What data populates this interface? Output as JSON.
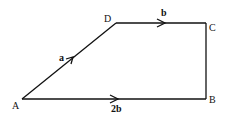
{
  "diagram": {
    "type": "trapezium-vectors",
    "stroke_color": "#111111",
    "vertices": {
      "A": {
        "label": "A",
        "x": 22,
        "y": 99
      },
      "B": {
        "label": "B",
        "x": 206,
        "y": 99
      },
      "C": {
        "label": "C",
        "x": 206,
        "y": 23
      },
      "D": {
        "label": "D",
        "x": 116,
        "y": 23
      }
    },
    "edges": [
      {
        "from": "A",
        "to": "D",
        "vector": "a",
        "arrow": true
      },
      {
        "from": "D",
        "to": "C",
        "vector": "b",
        "arrow": true
      },
      {
        "from": "C",
        "to": "B",
        "vector": "",
        "arrow": false
      },
      {
        "from": "A",
        "to": "B",
        "vector": "2b",
        "arrow": true
      }
    ],
    "vector_labels": {
      "AD": "a",
      "DC": "b",
      "AB": "2b"
    }
  }
}
